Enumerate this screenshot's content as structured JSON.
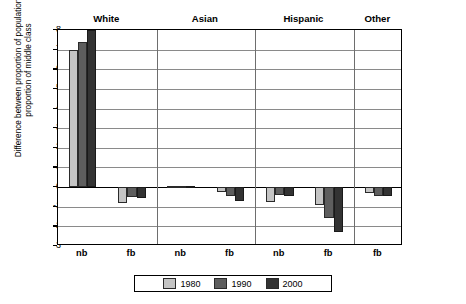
{
  "chart_data": {
    "type": "bar",
    "title": "",
    "subtitle": "",
    "xlabel": "",
    "ylabel": "Difference between proportion of population and proportion of middle class",
    "ylim": [
      -3,
      8
    ],
    "ytick_labels": [
      "8",
      "7",
      "6",
      "5",
      "4",
      "3",
      "2",
      "1",
      "0",
      "-1",
      "-2",
      "-3"
    ],
    "ytick_values": [
      8,
      7,
      6,
      5,
      4,
      3,
      2,
      1,
      0,
      -1,
      -2,
      -3
    ],
    "grid": true,
    "legend_position": "bottom",
    "groups": [
      "White",
      "Asian",
      "Hispanic",
      "Other"
    ],
    "categories": [
      "nb",
      "fb",
      "nb",
      "fb",
      "nb",
      "fb",
      "fb"
    ],
    "category_groups": [
      {
        "group": "White",
        "subcategories": [
          "nb",
          "fb"
        ]
      },
      {
        "group": "Asian",
        "subcategories": [
          "nb",
          "fb"
        ]
      },
      {
        "group": "Hispanic",
        "subcategories": [
          "nb",
          "fb"
        ]
      },
      {
        "group": "Other",
        "subcategories": [
          "fb"
        ]
      }
    ],
    "series": [
      {
        "name": "1980",
        "color": "#c4c4c4",
        "values": [
          7.0,
          -0.8,
          0.05,
          -0.25,
          -0.75,
          -0.9,
          -0.3
        ]
      },
      {
        "name": "1990",
        "color": "#5e5e5e",
        "values": [
          7.4,
          -0.5,
          0.05,
          -0.45,
          -0.4,
          -1.55,
          -0.45
        ]
      },
      {
        "name": "2000",
        "color": "#333333",
        "values": [
          8.0,
          -0.55,
          0.05,
          -0.7,
          -0.45,
          -2.3,
          -0.45
        ]
      }
    ],
    "annotations": [
      {
        "text": "Parity",
        "value": 0,
        "kind": "arrow-label",
        "position": "right-of-axis"
      }
    ]
  },
  "legend": {
    "entries": [
      {
        "label": "1980",
        "color": "#c4c4c4"
      },
      {
        "label": "1990",
        "color": "#5e5e5e"
      },
      {
        "label": "2000",
        "color": "#333333"
      }
    ]
  }
}
